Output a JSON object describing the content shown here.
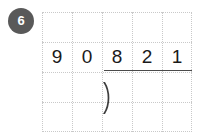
{
  "problem": {
    "number_label": "6"
  },
  "worksheet": {
    "grid": {
      "columns": 5,
      "rows": 4,
      "cell_size_px": 30,
      "line_color": "#c9c9c9",
      "line_style": "dotted"
    },
    "background_color": "#ffffff"
  },
  "division": {
    "operation": "long-division",
    "divisor": "90",
    "dividend": "821",
    "quotient": "",
    "divisor_digits": [
      "9",
      "0"
    ],
    "dividend_digits": [
      "8",
      "2",
      "1"
    ],
    "bracket_symbol": ")",
    "rule_color": "#4a4a4a",
    "digit_color": "#1a1a1a"
  },
  "badge": {
    "background_color": "#595959",
    "text_color": "#ffffff"
  }
}
